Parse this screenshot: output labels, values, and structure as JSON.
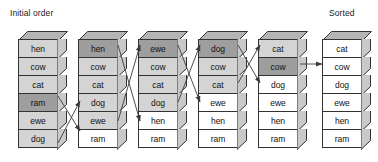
{
  "figure": {
    "title_left": "Initial order",
    "title_right": "Sorted",
    "line_color": "#333333",
    "shade_light": "#d4d4d4",
    "shade_dark": "#9e9e9e",
    "shade_none": "#ffffff",
    "face_side": "#c9c9c9",
    "face_top": "#b5b5b5"
  },
  "columns": [
    {
      "name": "column-0",
      "x": 18,
      "cells": [
        {
          "label": "hen",
          "shade": "light"
        },
        {
          "label": "cow",
          "shade": "light"
        },
        {
          "label": "cat",
          "shade": "light"
        },
        {
          "label": "ram",
          "shade": "dark"
        },
        {
          "label": "ewe",
          "shade": "light"
        },
        {
          "label": "dog",
          "shade": "light"
        }
      ]
    },
    {
      "name": "column-1",
      "x": 78,
      "cells": [
        {
          "label": "hen",
          "shade": "dark"
        },
        {
          "label": "cow",
          "shade": "light"
        },
        {
          "label": "cat",
          "shade": "light"
        },
        {
          "label": "dog",
          "shade": "light"
        },
        {
          "label": "ewe",
          "shade": "light"
        },
        {
          "label": "ram",
          "shade": "none"
        }
      ]
    },
    {
      "name": "column-2",
      "x": 138,
      "cells": [
        {
          "label": "ewe",
          "shade": "dark"
        },
        {
          "label": "cow",
          "shade": "light"
        },
        {
          "label": "cat",
          "shade": "light"
        },
        {
          "label": "dog",
          "shade": "light"
        },
        {
          "label": "hen",
          "shade": "none"
        },
        {
          "label": "ram",
          "shade": "none"
        }
      ]
    },
    {
      "name": "column-3",
      "x": 198,
      "cells": [
        {
          "label": "dog",
          "shade": "dark"
        },
        {
          "label": "cow",
          "shade": "light"
        },
        {
          "label": "cat",
          "shade": "light"
        },
        {
          "label": "ewe",
          "shade": "none"
        },
        {
          "label": "hen",
          "shade": "none"
        },
        {
          "label": "ram",
          "shade": "none"
        }
      ]
    },
    {
      "name": "column-4",
      "x": 258,
      "cells": [
        {
          "label": "cat",
          "shade": "light"
        },
        {
          "label": "cow",
          "shade": "dark"
        },
        {
          "label": "dog",
          "shade": "none"
        },
        {
          "label": "ewe",
          "shade": "none"
        },
        {
          "label": "hen",
          "shade": "none"
        },
        {
          "label": "ram",
          "shade": "none"
        }
      ]
    },
    {
      "name": "column-5",
      "x": 322,
      "cells": [
        {
          "label": "cat",
          "shade": "none"
        },
        {
          "label": "cow",
          "shade": "none"
        },
        {
          "label": "dog",
          "shade": "none"
        },
        {
          "label": "ewe",
          "shade": "none"
        },
        {
          "label": "hen",
          "shade": "none"
        },
        {
          "label": "ram",
          "shade": "none"
        }
      ]
    }
  ],
  "arrows": [
    {
      "name": "swap-ram-down",
      "from": [
        58,
        96
      ],
      "to": [
        80,
        131
      ]
    },
    {
      "name": "swap-dog-up",
      "from": [
        58,
        143
      ],
      "to": [
        80,
        101
      ]
    },
    {
      "name": "swap-ewe-up",
      "from": [
        118,
        121
      ],
      "to": [
        140,
        45
      ]
    },
    {
      "name": "swap-hen-down",
      "from": [
        118,
        45
      ],
      "to": [
        140,
        121
      ]
    },
    {
      "name": "swap-dog-up-2",
      "from": [
        178,
        102
      ],
      "to": [
        200,
        45
      ]
    },
    {
      "name": "swap-ewe-down",
      "from": [
        178,
        45
      ],
      "to": [
        200,
        102
      ]
    },
    {
      "name": "swap-cat-up",
      "from": [
        238,
        83
      ],
      "to": [
        260,
        45
      ]
    },
    {
      "name": "swap-dog-down",
      "from": [
        238,
        45
      ],
      "to": [
        260,
        83
      ]
    },
    {
      "name": "final-cow",
      "from": [
        300,
        64
      ],
      "to": [
        322,
        64
      ]
    }
  ]
}
